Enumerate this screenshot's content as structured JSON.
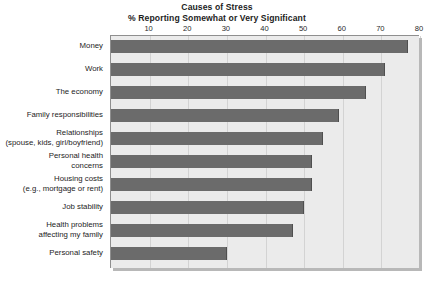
{
  "chart_data": {
    "type": "bar",
    "orientation": "horizontal",
    "title": "Causes of Stress",
    "subtitle": "% Reporting Somewhat or Very Significant",
    "xlabel": "",
    "ylabel": "",
    "xlim": [
      0,
      80
    ],
    "xticks": [
      10,
      20,
      30,
      40,
      50,
      60,
      70,
      80
    ],
    "grid": true,
    "legend": "none",
    "bar_color": "#6b6b6b",
    "plot_background": "#ebebeb",
    "categories": [
      "Money",
      "Work",
      "The economy",
      "Family responsibilities",
      "Relationships\n(spouse, kids, girl/boyfriend)",
      "Personal health\nconcerns",
      "Housing costs\n(e.g., mortgage or rent)",
      "Job stability",
      "Health problems\naffecting my family",
      "Personal safety"
    ],
    "values": [
      77,
      71,
      66,
      59,
      55,
      52,
      52,
      50,
      47,
      30
    ]
  }
}
